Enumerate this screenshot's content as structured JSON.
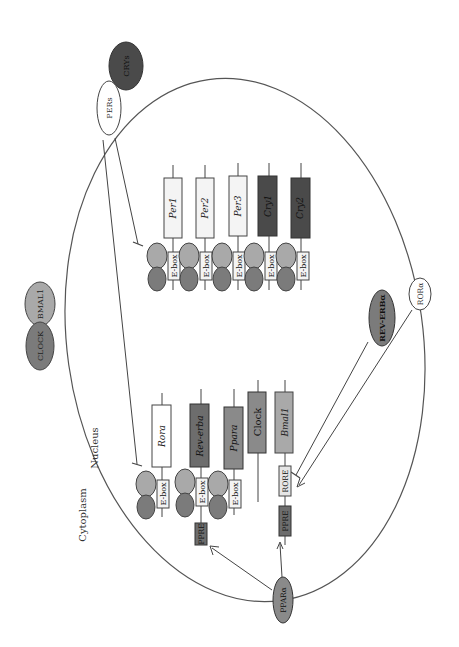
{
  "regions": {
    "cytoplasm_label": "Cytoplasm",
    "nucleus_label": "Nucleus"
  },
  "colors": {
    "white_fill": "#ffffff",
    "light_fill": "#f4f4f4",
    "mid_gray": "#a9a9a9",
    "gray": "#8a8a8a",
    "dark_gray": "#6d6d6d",
    "darkest": "#4a4a4a",
    "stroke": "#555555"
  },
  "proteins": {
    "cry": "CRYs",
    "per": "PERs",
    "clock": "CLOCK",
    "bmal1": "BMAL1",
    "rev_erb": "REV-ERBα",
    "ror": "RORα",
    "ppar": "PPARα"
  },
  "genes_top": [
    {
      "name": "Per1",
      "fill": "#f4f4f4",
      "element": "E-box"
    },
    {
      "name": "Per2",
      "fill": "#f4f4f4",
      "element": "E-box"
    },
    {
      "name": "Per3",
      "fill": "#f4f4f4",
      "element": "E-box"
    },
    {
      "name": "Cry1",
      "fill": "#4a4a4a",
      "element": "E-box"
    },
    {
      "name": "Cry2",
      "fill": "#4a4a4a",
      "element": "E-box"
    }
  ],
  "genes_bottom": [
    {
      "name": "Rora",
      "fill": "#ffffff",
      "element": "E-box"
    },
    {
      "name": "Rev-erba",
      "fill": "#6d6d6d",
      "element": "E-box",
      "extra": "PPRE"
    },
    {
      "name": "Ppara",
      "fill": "#8a8a8a",
      "element": "E-box"
    },
    {
      "name": "Clock",
      "fill": "#8a8a8a"
    },
    {
      "name": "Bmal1",
      "fill": "#a9a9a9",
      "element": "RORE",
      "extra": "PPRE"
    }
  ],
  "complex_labels": {
    "bmal1_small": "BMAL1",
    "clock_small": "CLOCK"
  }
}
